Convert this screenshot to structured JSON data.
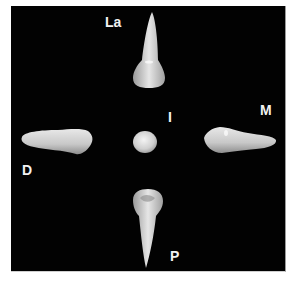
{
  "figure": {
    "background_color": "#020202",
    "tooth_color": "#d9d9d9",
    "views": [
      {
        "id": "labial",
        "label": "La"
      },
      {
        "id": "mesial",
        "label": "M"
      },
      {
        "id": "incisal",
        "label": "I"
      },
      {
        "id": "distal",
        "label": "D"
      },
      {
        "id": "palatal",
        "label": "P"
      }
    ]
  }
}
